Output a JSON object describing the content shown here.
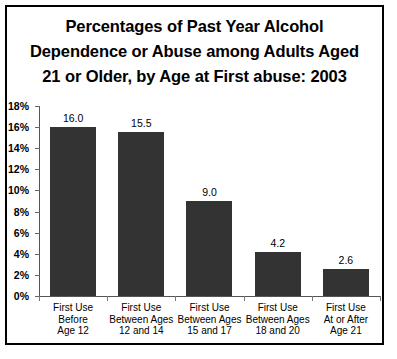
{
  "chart_data": {
    "type": "bar",
    "title": "Percentages of Past Year Alcohol Dependence or Abuse among Adults Aged 21 or Older, by Age at First abuse: 2003",
    "title_lines": [
      "Percentages of Past Year Alcohol",
      "Dependence or Abuse among Adults Aged",
      "21 or Older, by Age at First abuse: 2003"
    ],
    "categories": [
      "First Use Before Age 12",
      "First Use Between Ages 12 and 14",
      "First Use Between Ages 15 and 17",
      "First Use Between Ages 18 and 20",
      "First Use At or After Age 21"
    ],
    "category_lines": [
      [
        "First Use",
        "Before",
        "Age 12"
      ],
      [
        "First Use",
        "Between Ages",
        "12 and 14"
      ],
      [
        "First Use",
        "Between Ages",
        "15 and 17"
      ],
      [
        "First Use",
        "Between Ages",
        "18 and 20"
      ],
      [
        "First Use",
        "At or After",
        "Age 21"
      ]
    ],
    "values": [
      16.0,
      15.5,
      9.0,
      4.2,
      2.6
    ],
    "value_labels": [
      "16.0",
      "15.5",
      "9.0",
      "4.2",
      "2.6"
    ],
    "xlabel": "",
    "ylabel": "",
    "ylim": [
      0,
      18
    ],
    "ytick_values": [
      0,
      2,
      4,
      6,
      8,
      10,
      12,
      14,
      16,
      18
    ],
    "ytick_labels": [
      "0%",
      "2%",
      "4%",
      "6%",
      "8%",
      "10%",
      "12%",
      "14%",
      "16%",
      "18%"
    ],
    "grid": false,
    "legend": false,
    "bar_color": "#333333",
    "axis_color": "#555555",
    "text_color": "#000000",
    "background_color": "#ffffff",
    "border_color": "#000000"
  }
}
